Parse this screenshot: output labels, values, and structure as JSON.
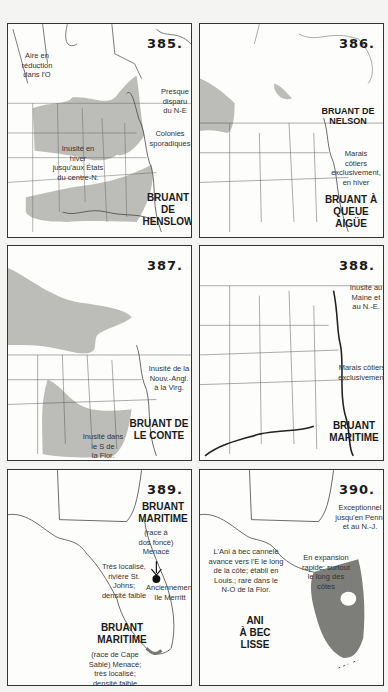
{
  "maps": [
    {
      "number": "385.",
      "title_line1": "BRUANT",
      "title_line2": "DE HENSLOW",
      "notes": {
        "west": "Aire en\nréduction\ndans l'O",
        "northeast": "Presque\ndisparu\ndu N-E",
        "sporadic": "Colonies\nsporadiques",
        "winter": "Inusité en\nhiver\njusqu'aux États\ndu centre-N."
      }
    },
    {
      "number": "386.",
      "title_line1": "BRUANT À",
      "title_line2": "QUEUE AIGÜE",
      "subtitle_line1": "BRUANT DE",
      "subtitle_line2": "NELSON",
      "notes": {
        "coastal": "Marais\ncôtiers\nexclusivement,\nen hiver"
      }
    },
    {
      "number": "387.",
      "title_line1": "BRUANT DE",
      "title_line2": "LE CONTE",
      "notes": {
        "ne": "Inusité de la\nNouv.-Angl.\nà la Virg.",
        "south": "Inusité dans\nle S de\nla Flor."
      }
    },
    {
      "number": "388.",
      "title_line1": "BRUANT",
      "title_line2": "MARITIME",
      "notes": {
        "maine": "Inusité au\nMaine et\nau N.-E.",
        "coastal": "Marais côtiers\nexclusivement"
      }
    },
    {
      "number": "389.",
      "title_top_line1": "BRUANT",
      "title_top_line2": "MARITIME",
      "title_bottom_line1": "BRUANT",
      "title_bottom_line2": "MARITIME",
      "notes": {
        "dusky": "(race à\ndos foncé)\nMenacé",
        "stjohns": "Très localisé,\nrivière St.\nJohns;\ndensité faible",
        "merritt": "Anciennement,\nîle Merritt",
        "capesable": "(race de Cape\nSable) Menacé;\ntrès localisé;\ndensité faible"
      }
    },
    {
      "number": "390.",
      "title_line1": "ANI",
      "title_line2": "À BEC",
      "title_line3": "LISSE",
      "notes": {
        "exceptional": "Exceptionnel\njusqu'en Penn.\net au N.-J.",
        "expansion": "En expansion\nrapide; surtout\nle long des\ncôtes",
        "groove": "L'Ani à bec cannelé\navance vers l'E le long\nde la côte; établi en\nLouis.; rare dans le\nN-O de la Flor."
      }
    }
  ],
  "colors": {
    "range_light": "#b9b9b6",
    "range_dark": "#7d7d7a",
    "lines": "#444444"
  }
}
